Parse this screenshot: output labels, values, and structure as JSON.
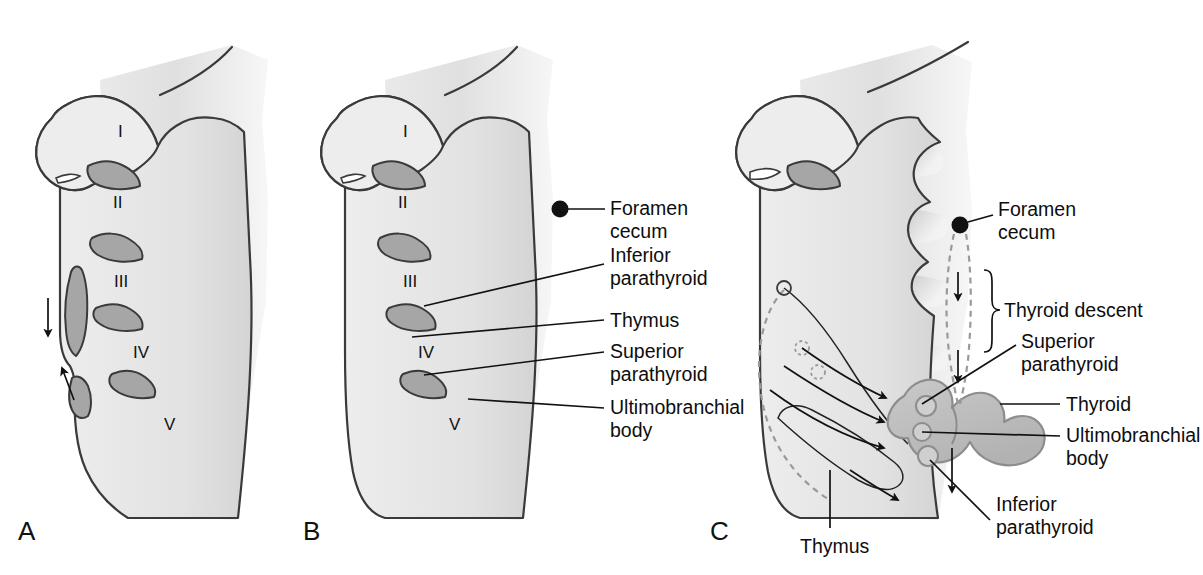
{
  "figure": {
    "panels": [
      {
        "id": "A",
        "letter": "A",
        "pouch_labels": [
          "I",
          "II",
          "III",
          "IV",
          "V"
        ],
        "annotations": [
          {
            "name": "descent-arrow",
            "icon": "arrow-down-icon"
          },
          {
            "name": "ascent-arrow",
            "icon": "arrow-up-icon"
          }
        ],
        "callouts": []
      },
      {
        "id": "B",
        "letter": "B",
        "pouch_labels": [
          "I",
          "II",
          "III",
          "IV",
          "V"
        ],
        "callouts": [
          {
            "name": "foramen-cecum",
            "lines": [
              "Foramen",
              "cecum"
            ],
            "marker": "dot"
          },
          {
            "name": "inferior-parathyroid",
            "lines": [
              "Inferior",
              "parathyroid"
            ],
            "marker": "leader"
          },
          {
            "name": "thymus",
            "lines": [
              "Thymus"
            ],
            "marker": "leader"
          },
          {
            "name": "superior-parathyroid",
            "lines": [
              "Superior",
              "parathyroid"
            ],
            "marker": "leader"
          },
          {
            "name": "ultimobranchial-body",
            "lines": [
              "Ultimobranchial",
              "body"
            ],
            "marker": "leader"
          }
        ]
      },
      {
        "id": "C",
        "letter": "C",
        "pouch_labels": [],
        "callouts": [
          {
            "name": "foramen-cecum",
            "lines": [
              "Foramen",
              "cecum"
            ],
            "marker": "dot"
          },
          {
            "name": "thyroid-descent",
            "lines": [
              "Thyroid descent"
            ],
            "marker": "brace"
          },
          {
            "name": "superior-parathyroid",
            "lines": [
              "Superior",
              "parathyroid"
            ],
            "marker": "leader"
          },
          {
            "name": "thyroid",
            "lines": [
              "Thyroid"
            ],
            "marker": "leader"
          },
          {
            "name": "ultimobranchial-body",
            "lines": [
              "Ultimobranchial",
              "body"
            ],
            "marker": "leader"
          },
          {
            "name": "inferior-parathyroid",
            "lines": [
              "Inferior",
              "parathyroid"
            ],
            "marker": "leader"
          },
          {
            "name": "thymus",
            "lines": [
              "Thymus"
            ],
            "marker": "leader"
          }
        ]
      }
    ],
    "text": {
      "panel_a_letter": "A",
      "panel_b_letter": "B",
      "panel_c_letter": "C",
      "roman_1": "I",
      "roman_2": "II",
      "roman_3": "III",
      "roman_4": "IV",
      "roman_5": "V",
      "foramen_l1": "Foramen",
      "foramen_l2": "cecum",
      "inferior_l1": "Inferior",
      "inferior_l2": "parathyroid",
      "thymus": "Thymus",
      "superior_l1": "Superior",
      "superior_l2": "parathyroid",
      "ultimo_l1": "Ultimobranchial",
      "ultimo_l2": "body",
      "thyroid_descent": "Thyroid descent",
      "thyroid": "Thyroid"
    },
    "colors": {
      "background": "#ffffff",
      "outline": "#3a3a3a",
      "pouch_fill_light": "#e6e6e6",
      "pouch_fill_mid": "#c9c9c9",
      "pouch_fill_dark": "#a9a9a9",
      "gland_fill": "#bdbdbd",
      "text": "#111111",
      "dashed_path": "#9a9a9a"
    }
  }
}
